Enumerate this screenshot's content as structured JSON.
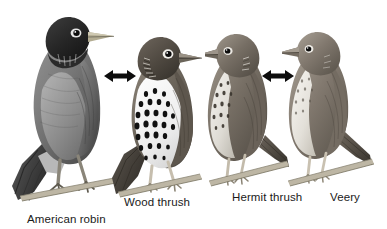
{
  "figure": {
    "background_color": "#ffffff",
    "ink_color": "#1a1a1a",
    "style": "grayscale pencil illustration"
  },
  "birds": [
    {
      "id": "american-robin",
      "label": "American robin",
      "icon_name": "american-robin-illustration",
      "pose": "perched on twig, facing right, head turned",
      "size_rank": 1,
      "plumage": "dark head, gray back, rufous breast"
    },
    {
      "id": "wood-thrush",
      "label": "Wood thrush",
      "icon_name": "wood-thrush-illustration",
      "pose": "perched on twig, facing right",
      "size_rank": 2,
      "plumage": "brown back, heavily black-spotted white breast"
    },
    {
      "id": "hermit-thrush",
      "label": "Hermit thrush",
      "icon_name": "hermit-thrush-illustration",
      "pose": "perched on twig, facing left",
      "size_rank": 3,
      "plumage": "brown back, lightly spotted pale breast"
    },
    {
      "id": "veery",
      "label": "Veery",
      "icon_name": "veery-illustration",
      "pose": "perched on twig, facing left",
      "size_rank": 4,
      "plumage": "warm brown back, faintly spotted buff breast"
    }
  ],
  "arrows": [
    {
      "id": "arrow-robin-woodthrush",
      "icon_name": "double-headed-arrow-icon",
      "direction": "left-right",
      "connects": [
        "American robin",
        "Wood thrush"
      ]
    },
    {
      "id": "arrow-hermit-veery",
      "icon_name": "double-headed-arrow-icon",
      "direction": "left-right",
      "connects": [
        "Hermit thrush",
        "Veery"
      ]
    }
  ]
}
